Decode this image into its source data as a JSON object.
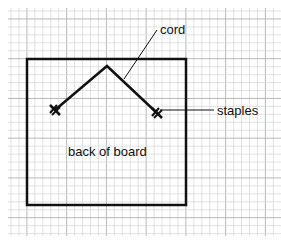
{
  "diagram": {
    "labels": {
      "cord": "cord",
      "staples": "staples",
      "board": "back of board"
    },
    "colors": {
      "background": "#ffffff",
      "grid_minor": "#d9d9d9",
      "grid_major": "#b8b8b8",
      "ink": "#111111"
    }
  }
}
